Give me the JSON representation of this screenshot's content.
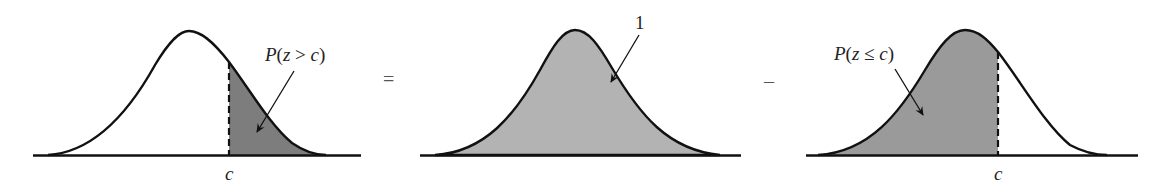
{
  "diagram": {
    "colors": {
      "curve": "#111111",
      "shade_dark": "#7d7d7d",
      "shade_total": "#b3b3b3",
      "shade_left": "#9a9a9a",
      "background": "#ffffff"
    },
    "panels": [
      {
        "id": "right-tail",
        "label": "P(z > c)",
        "label_prefix": "P",
        "label_body": "(z > c)",
        "axis_label": "c",
        "shaded_region": "right of c"
      },
      {
        "id": "total-area",
        "label": "1",
        "shaded_region": "entire area under curve"
      },
      {
        "id": "left-cumulative",
        "label": "P(z ≤ c)",
        "label_prefix": "P",
        "label_body": "(z ≤ c)",
        "axis_label": "c",
        "shaded_region": "left of c"
      }
    ],
    "operators": {
      "equals": "=",
      "minus": "–"
    }
  }
}
